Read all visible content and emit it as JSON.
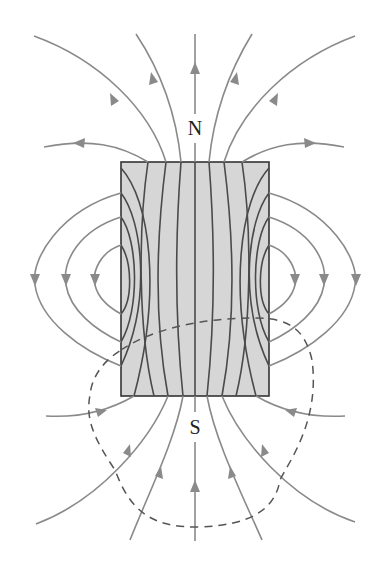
{
  "diagram": {
    "labels": {
      "north": "N",
      "south": "S"
    },
    "magnet": {
      "x": 121,
      "y": 162,
      "width": 148,
      "height": 234,
      "fill": "#d6d6d6",
      "border": "#333333"
    },
    "colors": {
      "field_line_outside": "#8a8a8a",
      "field_line_inside": "#4a4a4a",
      "dashed_surface": "#555555",
      "background": "#ffffff"
    },
    "elements": [
      "bar-magnet",
      "field-lines-exiting-north",
      "field-lines-entering-south",
      "side-loop-field-lines",
      "closed-dashed-gaussian-surface"
    ]
  }
}
